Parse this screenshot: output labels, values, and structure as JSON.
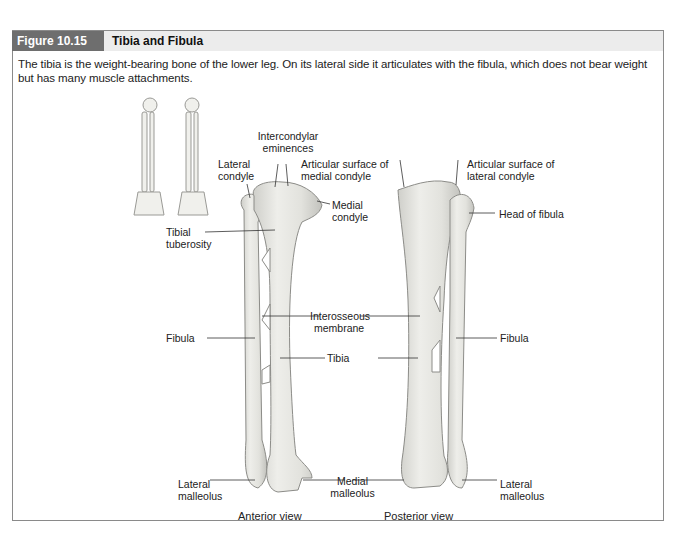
{
  "figure": {
    "number": "Figure 10.15",
    "title": "Tibia and Fibula",
    "caption": "The tibia is the weight-bearing bone of the lower leg. On its lateral side it articulates with the fibula, which does not bear weight but has many muscle attachments.",
    "colors": {
      "header_number_bg": "#6e6e6e",
      "header_bg": "#ececec",
      "border": "#8a8a8a",
      "bone": "#e6e6e1",
      "bone_outline": "#8c8c88"
    }
  },
  "anterior": {
    "view_label": "Anterior view",
    "labels": {
      "intercondylar": "Intercondylar eminences",
      "intercondylar_l1": "Intercondylar",
      "intercondylar_l2": "eminences",
      "lateral_condyle_l1": "Lateral",
      "lateral_condyle_l2": "condyle",
      "medial_condyle_l1": "Medial",
      "medial_condyle_l2": "condyle",
      "tibial_tuberosity_l1": "Tibial",
      "tibial_tuberosity_l2": "tuberosity",
      "fibula": "Fibula",
      "interosseous_l1": "Interosseous",
      "interosseous_l2": "membrane",
      "tibia": "Tibia",
      "lateral_malleolus_l1": "Lateral",
      "lateral_malleolus_l2": "malleolus",
      "medial_malleolus_l1": "Medial",
      "medial_malleolus_l2": "malleolus"
    }
  },
  "posterior": {
    "view_label": "Posterior view",
    "labels": {
      "art_medial_l1": "Articular surface of",
      "art_medial_l2": "medial condyle",
      "art_lateral_l1": "Articular surface of",
      "art_lateral_l2": "lateral condyle",
      "head_of_fibula": "Head of fibula",
      "fibula": "Fibula",
      "lateral_malleolus_l1": "Lateral",
      "lateral_malleolus_l2": "malleolus"
    }
  }
}
